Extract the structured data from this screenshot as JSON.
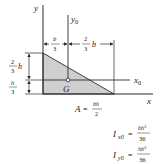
{
  "figure": {
    "shape": "right-triangle",
    "fill_color": "#cfcfcf",
    "line_color": "#2a2a2a",
    "axes": {
      "y_label": "y",
      "y0_label": "y",
      "y0_sub": "0",
      "x_label": "x",
      "x0_label": "x",
      "x0_sub": "0"
    },
    "centroid_label": "G",
    "dimensions": {
      "top_left": {
        "num": "b",
        "den": "3"
      },
      "top_right": {
        "num": "2",
        "den": "3",
        "var": "b"
      },
      "left_upper": {
        "num": "2",
        "den": "3",
        "var": "h"
      },
      "left_lower": {
        "num": "h",
        "den": "3"
      }
    },
    "formulas": {
      "area": {
        "lhs": "A",
        "num": "bh",
        "den": "2"
      },
      "ix0": {
        "lhs": "I",
        "sub": "x0",
        "num": "bh",
        "num_exp": "3",
        "den": "36"
      },
      "iy0": {
        "lhs": "I",
        "sub": "y0",
        "num": "hb",
        "num_exp": "3",
        "den": "36"
      }
    }
  }
}
